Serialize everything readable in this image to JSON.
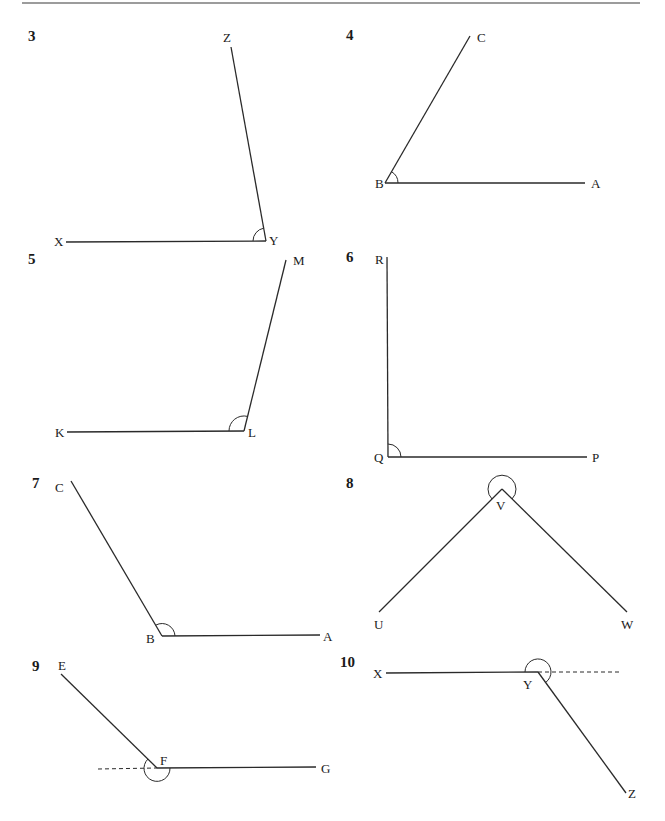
{
  "page": {
    "top_rule": true
  },
  "problems": [
    {
      "number": "3",
      "labels": {
        "p1": "Z",
        "vertex": "Y",
        "p2": "X"
      },
      "angle_type": "acute"
    },
    {
      "number": "4",
      "labels": {
        "p1": "C",
        "vertex": "B",
        "p2": "A"
      },
      "angle_type": "acute"
    },
    {
      "number": "5",
      "labels": {
        "p1": "M",
        "vertex": "L",
        "p2": "K"
      },
      "angle_type": "obtuse"
    },
    {
      "number": "6",
      "labels": {
        "p1": "R",
        "vertex": "Q",
        "p2": "P"
      },
      "angle_type": "right"
    },
    {
      "number": "7",
      "labels": {
        "p1": "C",
        "vertex": "B",
        "p2": "A"
      },
      "angle_type": "obtuse"
    },
    {
      "number": "8",
      "labels": {
        "p1": "U",
        "vertex": "V",
        "p2": "W"
      },
      "angle_type": "reflex"
    },
    {
      "number": "9",
      "labels": {
        "p1": "E",
        "vertex": "F",
        "p2": "G"
      },
      "angle_type": "reflex"
    },
    {
      "number": "10",
      "labels": {
        "p1": "X",
        "vertex": "Y",
        "p2": "Z"
      },
      "angle_type": "reflex"
    }
  ]
}
